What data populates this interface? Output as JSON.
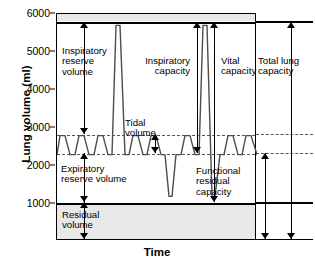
{
  "chart_data": {
    "type": "line",
    "xlabel": "Time",
    "ylabel": "Lung volume (ml)",
    "ylim": [
      0,
      6000
    ],
    "yticks": [
      6000,
      5000,
      4000,
      3000,
      2000,
      1000
    ],
    "grid": false,
    "legend_position": "none",
    "reference_levels": [
      {
        "name": "total-lung-capacity-line",
        "value": 5700,
        "style": "solid-bold"
      },
      {
        "name": "tidal-peak-line",
        "value": 2800,
        "style": "dashed"
      },
      {
        "name": "functional-residual-capacity-line",
        "value": 2300,
        "style": "dashed"
      },
      {
        "name": "residual-volume-line",
        "value": 1200,
        "style": "solid-bold"
      }
    ],
    "volumes": [
      {
        "key": "inspiratory_reserve_volume",
        "label": "Inspiratory\nreserve\nvolume",
        "from": 2800,
        "to": 5700,
        "value": 2900
      },
      {
        "key": "tidal_volume",
        "label": "Tidal\nvolume",
        "from": 2300,
        "to": 2800,
        "value": 500
      },
      {
        "key": "expiratory_reserve_volume",
        "label": "Expiratory\nreserve volume",
        "from": 1200,
        "to": 2300,
        "value": 1100
      },
      {
        "key": "residual_volume",
        "label": "Residual\nvolume",
        "from": 0,
        "to": 1200,
        "value": 1200
      }
    ],
    "capacities": [
      {
        "key": "inspiratory_capacity",
        "label": "Inspiratory\ncapacity",
        "from": 2300,
        "to": 5700,
        "value": 3400
      },
      {
        "key": "vital_capacity",
        "label": "Vital\ncapacity",
        "from": 1200,
        "to": 5700,
        "value": 4500
      },
      {
        "key": "functional_residual_capacity",
        "label": "Functional\nresidual\ncapacity",
        "from": 0,
        "to": 2300,
        "value": 2300
      },
      {
        "key": "total_lung_capacity",
        "label": "Total lung\ncapacity",
        "from": 0,
        "to": 5700,
        "value": 5700
      }
    ],
    "series": [
      {
        "name": "spirogram-trace",
        "comment": "x in arbitrary time units 0-200, y in ml",
        "points": [
          [
            0,
            2300
          ],
          [
            3,
            2800
          ],
          [
            8,
            2800
          ],
          [
            13,
            2300
          ],
          [
            18,
            2300
          ],
          [
            22,
            2800
          ],
          [
            27,
            2800
          ],
          [
            32,
            2300
          ],
          [
            37,
            2300
          ],
          [
            41,
            2800
          ],
          [
            46,
            2800
          ],
          [
            51,
            2300
          ],
          [
            55,
            2300
          ],
          [
            59,
            5700
          ],
          [
            63,
            5700
          ],
          [
            68,
            2300
          ],
          [
            72,
            2300
          ],
          [
            76,
            2800
          ],
          [
            81,
            2800
          ],
          [
            86,
            2300
          ],
          [
            90,
            2300
          ],
          [
            94,
            2800
          ],
          [
            99,
            2800
          ],
          [
            104,
            2300
          ],
          [
            108,
            2300
          ],
          [
            112,
            1200
          ],
          [
            115,
            1200
          ],
          [
            119,
            2300
          ],
          [
            124,
            2300
          ],
          [
            128,
            2800
          ],
          [
            133,
            2800
          ],
          [
            138,
            2300
          ],
          [
            142,
            2300
          ],
          [
            146,
            5700
          ],
          [
            150,
            5700
          ],
          [
            155,
            1200
          ],
          [
            158,
            1200
          ],
          [
            163,
            2300
          ],
          [
            167,
            2300
          ],
          [
            171,
            2800
          ],
          [
            176,
            2800
          ],
          [
            181,
            2300
          ],
          [
            185,
            2300
          ],
          [
            189,
            2800
          ],
          [
            194,
            2800
          ],
          [
            200,
            2300
          ]
        ]
      }
    ]
  },
  "axis": {
    "y_label": "Lung volume (ml)",
    "x_label": "Time",
    "ticks": [
      "6000",
      "5000",
      "4000",
      "3000",
      "2000",
      "1000"
    ]
  },
  "annotations": {
    "inspiratory_reserve_volume": "Inspiratory\nreserve\nvolume",
    "tidal_volume": "Tidal\nvolume",
    "expiratory_reserve_volume": "Expiratory\nreserve volume",
    "residual_volume": "Residual\nvolume",
    "inspiratory_capacity": "Inspiratory\ncapacity",
    "vital_capacity": "Vital\ncapacity",
    "functional_residual_capacity": "Functional\nresidual\ncapacity",
    "total_lung_capacity": "Total lung\ncapacity"
  },
  "colors": {
    "trace": "#4d4d4d",
    "axis": "#000000",
    "band": "#e8e8e8",
    "dashed": "#555555"
  }
}
